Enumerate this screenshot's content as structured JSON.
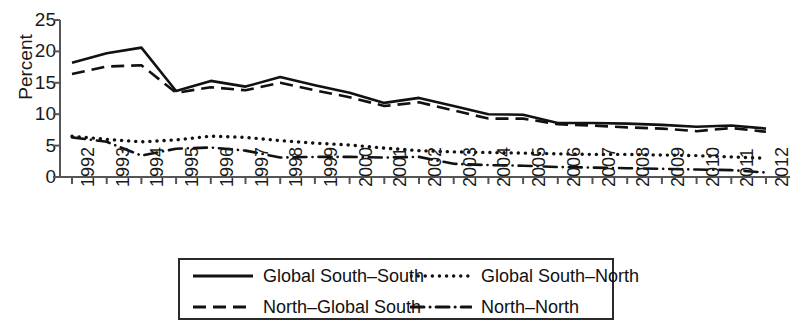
{
  "chart_data": {
    "type": "line",
    "title": "",
    "xlabel": "",
    "ylabel": "Percent",
    "ylim": [
      0,
      25
    ],
    "yticks": [
      0,
      5,
      10,
      15,
      20,
      25
    ],
    "grid": false,
    "legend_position": "bottom",
    "categories": [
      "1992",
      "1993",
      "1994",
      "1995",
      "1996",
      "1997",
      "1998",
      "1999",
      "2000",
      "2001",
      "2002",
      "2003",
      "2004",
      "2005",
      "2006",
      "2007",
      "2008",
      "2009",
      "2010",
      "2011",
      "2012"
    ],
    "series": [
      {
        "name": "Global South–South",
        "style": "solid",
        "values": [
          18.2,
          19.7,
          20.6,
          13.7,
          15.3,
          14.4,
          15.9,
          14.6,
          13.4,
          11.8,
          12.6,
          11.3,
          10.0,
          9.9,
          8.6,
          8.6,
          8.5,
          8.3,
          8.0,
          8.2,
          7.7
        ]
      },
      {
        "name": "Global South–North",
        "style": "dotted",
        "values": [
          6.5,
          6.0,
          5.6,
          5.9,
          6.5,
          6.3,
          5.8,
          5.4,
          5.1,
          4.6,
          4.2,
          4.0,
          3.9,
          3.8,
          3.7,
          3.6,
          3.6,
          3.5,
          3.4,
          3.2,
          3.0
        ]
      },
      {
        "name": "North–Global South",
        "style": "dashed",
        "values": [
          16.4,
          17.6,
          17.8,
          13.4,
          14.3,
          13.8,
          15.0,
          13.8,
          12.7,
          11.3,
          11.9,
          10.6,
          9.3,
          9.3,
          8.4,
          8.2,
          7.9,
          7.7,
          7.3,
          7.8,
          7.2
        ]
      },
      {
        "name": "North–North",
        "style": "dashdot",
        "values": [
          6.3,
          5.6,
          3.4,
          4.5,
          4.7,
          4.2,
          3.1,
          3.2,
          3.2,
          3.1,
          3.2,
          2.1,
          1.9,
          1.8,
          1.6,
          1.5,
          1.4,
          1.3,
          1.2,
          1.1,
          0.7
        ]
      }
    ]
  },
  "legend": {
    "entries": [
      {
        "label": "Global South–South",
        "style": "solid"
      },
      {
        "label": "Global South–North",
        "style": "dotted"
      },
      {
        "label": "North–Global South",
        "style": "dashed"
      },
      {
        "label": "North–North",
        "style": "dashdot"
      }
    ]
  }
}
